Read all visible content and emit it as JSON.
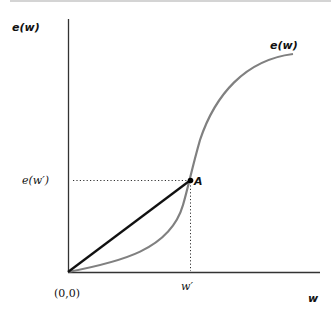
{
  "diagram": {
    "y_axis_label": "e(w)",
    "x_axis_label": "w",
    "curve_label": "e(w)",
    "origin_label": "(0,0)",
    "point_label": "A",
    "x_tick_label": "w′",
    "y_tick_label": "e(w′)",
    "colors": {
      "axes": "#333333",
      "curve": "#808080",
      "chord": "#111111",
      "guides": "#333333",
      "point": "#000000"
    },
    "elements": [
      {
        "type": "axis",
        "name": "y-axis"
      },
      {
        "type": "axis",
        "name": "x-axis"
      },
      {
        "type": "curve",
        "name": "e(w)",
        "shape": "S-shaped (convex then concave)"
      },
      {
        "type": "line",
        "name": "chord from origin to A"
      },
      {
        "type": "guide",
        "name": "dotted horizontal from e(w′) to A"
      },
      {
        "type": "guide",
        "name": "dotted vertical from A to w′"
      },
      {
        "type": "point",
        "name": "A"
      }
    ]
  }
}
